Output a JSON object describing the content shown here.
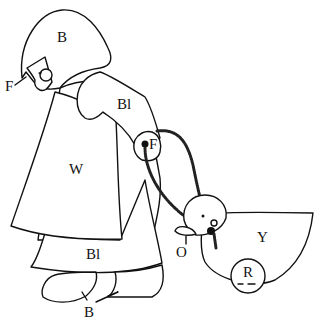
{
  "figure": {
    "labels": {
      "bonnet": "B",
      "face": "F",
      "sleeve": "Bl",
      "hand": "F",
      "apron": "W",
      "skirt": "Bl",
      "shoes": "B",
      "duck_body": "Y",
      "duck_beak": "O",
      "wheel": "R"
    },
    "colors": {
      "line": "#111111",
      "background": "#ffffff"
    }
  }
}
